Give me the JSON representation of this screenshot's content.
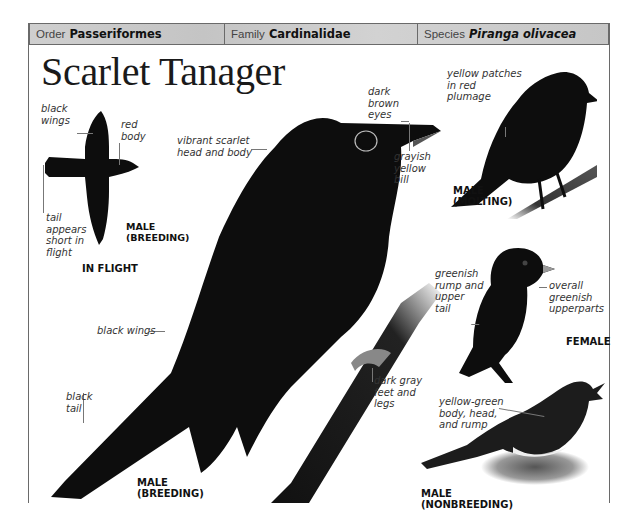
{
  "taxonomy": [
    {
      "key": "Order",
      "value": "Passeriformes",
      "italic": false
    },
    {
      "key": "Family",
      "value": "Cardinalidae",
      "italic": false
    },
    {
      "key": "Species",
      "value": "Piranga olivacea",
      "italic": true
    }
  ],
  "title": "Scarlet Tanager",
  "in_flight": {
    "caption": "IN FLIGHT",
    "sex_caption": "MALE\n(BREEDING)",
    "labels": {
      "wings": "black\nwings",
      "body": "red\nbody",
      "tail": "tail\nappears\nshort in\nflight"
    }
  },
  "main_bird": {
    "caption": "MALE\n(BREEDING)",
    "labels": {
      "head": "vibrant scarlet\nhead and body",
      "eyes": "dark\nbrown\neyes",
      "bill": "grayish\nyellow\nbill",
      "wings": "black wings",
      "tail": "black\ntail",
      "feet": "dark gray\nfeet and\nlegs"
    }
  },
  "molting": {
    "caption": "MALE\n(MOLTING)",
    "labels": {
      "patches": "yellow patches\nin red\nplumage"
    }
  },
  "female": {
    "caption": "FEMALE",
    "labels": {
      "rump": "greenish\nrump and\nupper\ntail",
      "upperparts": "overall\ngreenish\nupperparts"
    }
  },
  "nonbreeding": {
    "caption": "MALE\n(NONBREEDING)",
    "labels": {
      "body": "yellow-green\nbody, head,\nand rump"
    }
  },
  "colors": {
    "frame": "#6a6a6a",
    "header_bg": "#cbcbcb",
    "bird": "#0d0d0d",
    "text": "#333333"
  }
}
